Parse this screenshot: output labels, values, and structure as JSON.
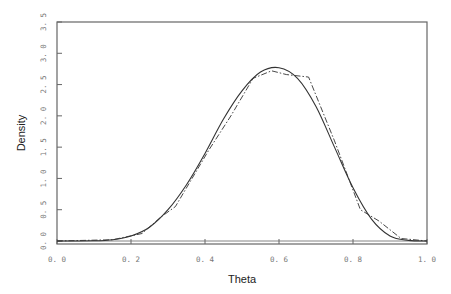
{
  "chart_data": {
    "type": "line",
    "title": "",
    "xlabel": "Theta",
    "ylabel": "Density",
    "xlim": [
      0.0,
      1.0
    ],
    "ylim": [
      0.0,
      3.5
    ],
    "grid": false,
    "legend": null,
    "x_ticks": [
      0.0,
      0.2,
      0.4,
      0.6,
      0.8,
      1.0
    ],
    "x_tick_labels": [
      "0. 0",
      "0. 2",
      "0. 4",
      "0. 6",
      "0. 8",
      "1. 0"
    ],
    "y_ticks": [
      0.0,
      0.5,
      1.0,
      1.5,
      2.0,
      2.5,
      3.0,
      3.5
    ],
    "y_tick_labels": [
      "0. 0",
      "0. 5",
      "1. 0",
      "1. 5",
      "2. 0",
      "2. 5",
      "3. 0",
      "3. 5"
    ],
    "series": [
      {
        "name": "smooth density",
        "style": "solid",
        "x": [
          0.0,
          0.1,
          0.15,
          0.2,
          0.25,
          0.3,
          0.35,
          0.4,
          0.45,
          0.5,
          0.55,
          0.6,
          0.65,
          0.7,
          0.75,
          0.8,
          0.85,
          0.9,
          0.95,
          1.0
        ],
        "y": [
          0.0,
          0.003,
          0.02,
          0.08,
          0.22,
          0.5,
          0.9,
          1.4,
          1.95,
          2.4,
          2.7,
          2.77,
          2.6,
          2.15,
          1.5,
          0.85,
          0.35,
          0.08,
          0.01,
          0.0
        ]
      },
      {
        "name": "piecewise approximation",
        "style": "dashed",
        "x": [
          0.0,
          0.15,
          0.23,
          0.28,
          0.32,
          0.36,
          0.41,
          0.47,
          0.53,
          0.58,
          0.62,
          0.68,
          0.75,
          0.82,
          0.87,
          0.93,
          1.0
        ],
        "y": [
          0.0,
          0.02,
          0.12,
          0.38,
          0.55,
          0.95,
          1.45,
          2.0,
          2.6,
          2.72,
          2.66,
          2.62,
          1.6,
          0.5,
          0.32,
          0.04,
          0.0
        ]
      }
    ]
  }
}
